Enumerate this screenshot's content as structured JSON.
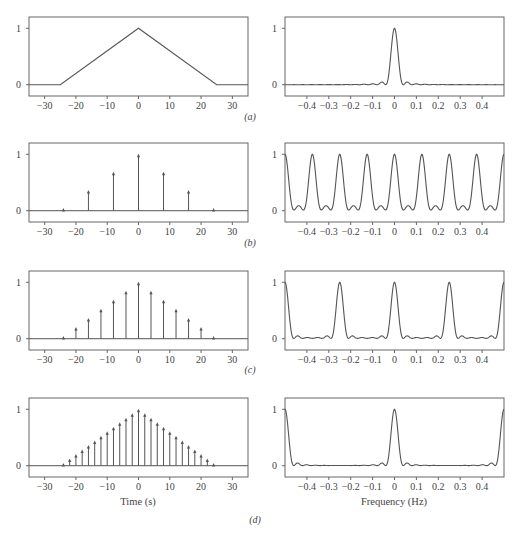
{
  "figure": {
    "panel_captions": [
      "(a)",
      "(b)",
      "(c)",
      "(d)"
    ],
    "time_axis_label": "Time (s)",
    "freq_axis_label": "Frequency (Hz)",
    "line_color": "#555555",
    "frame_color": "#666666"
  },
  "chart_data": [
    {
      "panel": "a-left",
      "type": "line",
      "title": "",
      "xlabel": "",
      "ylabel": "",
      "xlim": [
        -35,
        35
      ],
      "ylim": [
        -0.2,
        1.2
      ],
      "xticks": [
        -30,
        -20,
        -10,
        0,
        10,
        20,
        30
      ],
      "yticks": [
        0,
        1
      ],
      "x": [
        -35,
        -25,
        0,
        25,
        35
      ],
      "y": [
        0,
        0,
        1,
        0,
        0
      ],
      "description": "continuous triangle pulse, half-width 25 s"
    },
    {
      "panel": "a-right",
      "type": "line",
      "xlim": [
        -0.5,
        0.5
      ],
      "ylim": [
        -0.2,
        1.2
      ],
      "xticks": [
        -0.4,
        -0.3,
        -0.2,
        -0.1,
        0,
        0.1,
        0.2,
        0.3,
        0.4
      ],
      "yticks": [
        0,
        1
      ],
      "description": "normalized spectrum of triangle: single sinc^2 main lobe at 0 Hz, peak 1, first nulls near ±0.04 Hz, small sidelobes at ±0.06 Hz"
    },
    {
      "panel": "b-left",
      "type": "stem",
      "xlim": [
        -35,
        35
      ],
      "ylim": [
        -0.2,
        1.2
      ],
      "xticks": [
        -30,
        -20,
        -10,
        0,
        10,
        20,
        30
      ],
      "yticks": [
        0,
        1
      ],
      "sample_interval": 8,
      "x": [
        -24,
        -16,
        -8,
        0,
        8,
        16,
        24
      ],
      "y": [
        0.04,
        0.36,
        0.68,
        1.0,
        0.68,
        0.36,
        0.04
      ]
    },
    {
      "panel": "b-right",
      "type": "line",
      "xlim": [
        -0.5,
        0.5
      ],
      "ylim": [
        -0.2,
        1.2
      ],
      "xticks": [
        -0.4,
        -0.3,
        -0.2,
        -0.1,
        0,
        0.1,
        0.2,
        0.3,
        0.4
      ],
      "yticks": [
        0,
        1
      ],
      "sample_interval": 8,
      "peaks_at": [
        -0.5,
        -0.375,
        -0.25,
        -0.125,
        0,
        0.125,
        0.25,
        0.375,
        0.5
      ],
      "description": "periodic spectrum, replicas every 0.125 Hz, peak 1"
    },
    {
      "panel": "c-left",
      "type": "stem",
      "xlim": [
        -35,
        35
      ],
      "ylim": [
        -0.2,
        1.2
      ],
      "xticks": [
        -30,
        -20,
        -10,
        0,
        10,
        20,
        30
      ],
      "yticks": [
        0,
        1
      ],
      "sample_interval": 4,
      "x": [
        -24,
        -20,
        -16,
        -12,
        -8,
        -4,
        0,
        4,
        8,
        12,
        16,
        20,
        24
      ],
      "y": [
        0.04,
        0.2,
        0.36,
        0.52,
        0.68,
        0.84,
        1.0,
        0.84,
        0.68,
        0.52,
        0.36,
        0.2,
        0.04
      ]
    },
    {
      "panel": "c-right",
      "type": "line",
      "xlim": [
        -0.5,
        0.5
      ],
      "ylim": [
        -0.2,
        1.2
      ],
      "xticks": [
        -0.4,
        -0.3,
        -0.2,
        -0.1,
        0,
        0.1,
        0.2,
        0.3,
        0.4
      ],
      "yticks": [
        0,
        1
      ],
      "sample_interval": 4,
      "peaks_at": [
        -0.5,
        -0.25,
        0,
        0.25,
        0.5
      ],
      "description": "periodic spectrum, replicas every 0.25 Hz, peak 1"
    },
    {
      "panel": "d-left",
      "type": "stem",
      "xlim": [
        -35,
        35
      ],
      "ylim": [
        -0.2,
        1.2
      ],
      "xticks": [
        -30,
        -20,
        -10,
        0,
        10,
        20,
        30
      ],
      "yticks": [
        0,
        1
      ],
      "xlabel": "Time (s)",
      "sample_interval": 2,
      "x": [
        -24,
        -22,
        -20,
        -18,
        -16,
        -14,
        -12,
        -10,
        -8,
        -6,
        -4,
        -2,
        0,
        2,
        4,
        6,
        8,
        10,
        12,
        14,
        16,
        18,
        20,
        22,
        24
      ],
      "y": [
        0.04,
        0.12,
        0.2,
        0.28,
        0.36,
        0.44,
        0.52,
        0.6,
        0.68,
        0.76,
        0.84,
        0.92,
        1.0,
        0.92,
        0.84,
        0.76,
        0.68,
        0.6,
        0.52,
        0.44,
        0.36,
        0.28,
        0.2,
        0.12,
        0.04
      ]
    },
    {
      "panel": "d-right",
      "type": "line",
      "xlim": [
        -0.5,
        0.5
      ],
      "ylim": [
        -0.2,
        1.2
      ],
      "xticks": [
        -0.4,
        -0.3,
        -0.2,
        -0.1,
        0,
        0.1,
        0.2,
        0.3,
        0.4
      ],
      "yticks": [
        0,
        1
      ],
      "xlabel": "Frequency (Hz)",
      "sample_interval": 2,
      "peaks_at": [
        -0.5,
        0,
        0.5
      ],
      "description": "periodic spectrum, replicas every 0.5 Hz, peak 1"
    }
  ]
}
